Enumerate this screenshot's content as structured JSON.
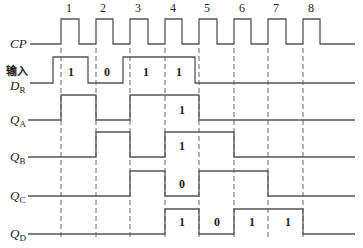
{
  "diagram": {
    "clock_numbers": [
      "1",
      "2",
      "3",
      "4",
      "5",
      "6",
      "7",
      "8"
    ],
    "input_label": "输入",
    "signals": [
      {
        "id": "CP",
        "main": "CP",
        "sub": ""
      },
      {
        "id": "DR",
        "main": "D",
        "sub": "R"
      },
      {
        "id": "QA",
        "main": "Q",
        "sub": "A"
      },
      {
        "id": "QB",
        "main": "Q",
        "sub": "B"
      },
      {
        "id": "QC",
        "main": "Q",
        "sub": "C"
      },
      {
        "id": "QD",
        "main": "Q",
        "sub": "D"
      }
    ],
    "dr_bits": [
      "1",
      "0",
      "1",
      "1"
    ],
    "qa_bits": [
      "1"
    ],
    "qb_bits": [
      "1"
    ],
    "qc_bits": [
      "0"
    ],
    "qd_bits": [
      "1",
      "0",
      "1",
      "1"
    ],
    "colors": {
      "line": "#555555",
      "dash": "#666666",
      "text": "#222222"
    }
  }
}
